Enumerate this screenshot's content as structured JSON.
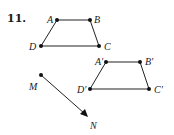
{
  "problem": {
    "number": "11."
  },
  "figure": {
    "original": {
      "name": "ABCD",
      "points": [
        {
          "id": "A",
          "label": "A",
          "x": 57,
          "y": 20,
          "lx": 47,
          "ly": 23
        },
        {
          "id": "B",
          "label": "B",
          "x": 90,
          "y": 20,
          "lx": 94,
          "ly": 23
        },
        {
          "id": "C",
          "label": "C",
          "x": 99,
          "y": 46,
          "lx": 104,
          "ly": 50
        },
        {
          "id": "D",
          "label": "D",
          "x": 41,
          "y": 46,
          "lx": 29,
          "ly": 50
        }
      ]
    },
    "image": {
      "name": "A'B'C'D'",
      "points": [
        {
          "id": "A1",
          "label": "A′",
          "x": 106,
          "y": 62,
          "lx": 95,
          "ly": 65
        },
        {
          "id": "B1",
          "label": "B′",
          "x": 140,
          "y": 62,
          "lx": 145,
          "ly": 65
        },
        {
          "id": "C1",
          "label": "C′",
          "x": 149,
          "y": 89,
          "lx": 154,
          "ly": 93
        },
        {
          "id": "D1",
          "label": "D′",
          "x": 90,
          "y": 89,
          "lx": 77,
          "ly": 93
        }
      ]
    },
    "vector": {
      "name": "MN",
      "start": {
        "label": "M",
        "x": 41,
        "y": 75,
        "lx": 29,
        "ly": 90
      },
      "end": {
        "label": "N",
        "x": 87,
        "y": 116,
        "lx": 90,
        "ly": 129
      }
    }
  }
}
